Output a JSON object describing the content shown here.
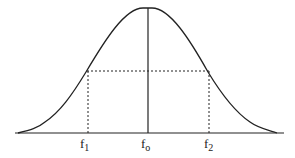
{
  "diagram": {
    "title": "",
    "curve": "bell-shaped (Gaussian) curve",
    "labels": {
      "f1_main": "f",
      "f1_sub": "1",
      "f0_main": "f",
      "f0_sub": "o",
      "f2_main": "f",
      "f2_sub": "2"
    },
    "colors": {
      "line": "#222222",
      "background": "#ffffff"
    }
  }
}
